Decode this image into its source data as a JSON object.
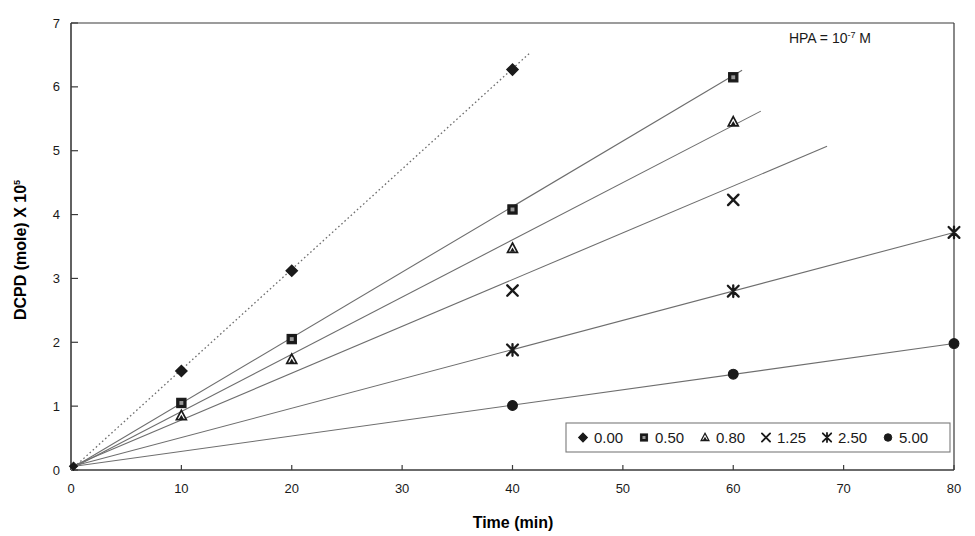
{
  "chart_data": {
    "type": "scatter",
    "title": "",
    "xlabel": "Time (min)",
    "ylabel": "DCPD (mole) X 10",
    "ylabel_exponent": "5",
    "xlim": [
      0,
      80
    ],
    "ylim": [
      0,
      7
    ],
    "xticks": [
      "0",
      "10",
      "20",
      "30",
      "40",
      "50",
      "60",
      "70",
      "80"
    ],
    "xtick_values": [
      0,
      10,
      20,
      30,
      40,
      50,
      60,
      70,
      80
    ],
    "yticks": [
      "0",
      "1",
      "2",
      "3",
      "4",
      "5",
      "6",
      "7"
    ],
    "ytick_values": [
      0,
      1,
      2,
      3,
      4,
      5,
      6,
      7
    ],
    "grid": false,
    "legend_position": "inside-bottom-right",
    "annotation": {
      "prefix": "HPA = 10",
      "exponent": "-7",
      "suffix": " M"
    },
    "series": [
      {
        "name": "0.00",
        "marker": "diamond",
        "color": "#1a1a1a",
        "x": [
          0,
          10,
          20,
          40
        ],
        "y": [
          0.05,
          1.55,
          3.12,
          6.27
        ],
        "trendline": {
          "x0": 0,
          "y0": 0.0,
          "x1": 41.5,
          "y1": 6.52
        },
        "trendline_style": "dotted"
      },
      {
        "name": "0.50",
        "marker": "square",
        "color": "#1a1a1a",
        "x": [
          0,
          10,
          20,
          40,
          60
        ],
        "y": [
          0.05,
          1.05,
          2.05,
          4.08,
          6.15
        ],
        "trendline": {
          "x0": 0,
          "y0": 0.02,
          "x1": 60.8,
          "y1": 6.26
        },
        "trendline_style": "solid"
      },
      {
        "name": "0.80",
        "marker": "triangle",
        "color": "#1a1a1a",
        "x": [
          0,
          10,
          20,
          40,
          60
        ],
        "y": [
          0.05,
          0.85,
          1.73,
          3.47,
          5.45
        ],
        "trendline": {
          "x0": 0,
          "y0": 0.02,
          "x1": 62.5,
          "y1": 5.62
        },
        "trendline_style": "solid"
      },
      {
        "name": "1.25",
        "marker": "cross",
        "color": "#1a1a1a",
        "x": [
          0,
          40,
          60
        ],
        "y": [
          0.05,
          2.81,
          4.23
        ],
        "trendline": {
          "x0": 0,
          "y0": 0.05,
          "x1": 68.5,
          "y1": 5.07
        },
        "trendline_style": "solid"
      },
      {
        "name": "2.50",
        "marker": "star",
        "color": "#1a1a1a",
        "x": [
          0,
          40,
          60,
          80
        ],
        "y": [
          0.05,
          1.88,
          2.8,
          3.72
        ],
        "trendline": {
          "x0": 0,
          "y0": 0.05,
          "x1": 80,
          "y1": 3.72
        },
        "trendline_style": "solid"
      },
      {
        "name": "5.00",
        "marker": "circle",
        "color": "#1a1a1a",
        "x": [
          0,
          40,
          60,
          80
        ],
        "y": [
          0.05,
          1.01,
          1.5,
          1.98
        ],
        "trendline": {
          "x0": 0,
          "y0": 0.05,
          "x1": 80,
          "y1": 1.98
        },
        "trendline_style": "solid"
      }
    ],
    "legend_entries": [
      {
        "label": "0.00",
        "marker": "diamond"
      },
      {
        "label": "0.50",
        "marker": "square"
      },
      {
        "label": "0.80",
        "marker": "triangle"
      },
      {
        "label": "1.25",
        "marker": "cross"
      },
      {
        "label": "2.50",
        "marker": "star"
      },
      {
        "label": "5.00",
        "marker": "circle"
      }
    ]
  },
  "colors": {
    "axis": "#3a3a3a",
    "ink": "#1a1a1a",
    "trendline": "#6e6e6e",
    "background": "#ffffff",
    "legend_border": "#7a7a7a"
  }
}
